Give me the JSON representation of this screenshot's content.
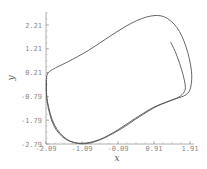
{
  "chart_data": {
    "type": "line",
    "title": "",
    "xlabel": "x",
    "ylabel": "y",
    "xlim": [
      -2.09,
      1.91
    ],
    "ylim": [
      -2.79,
      2.71
    ],
    "x_ticks": [
      "-2.09",
      "-1.09",
      "-0.09",
      "0.91",
      "1.91"
    ],
    "y_ticks": [
      "-2.79",
      "-1.79",
      "-0.79",
      "0.21",
      "1.21",
      "2.21"
    ],
    "grid": false,
    "legend": null,
    "series": [
      {
        "name": "trajectory (limit cycle)",
        "color": "#555555",
        "points": [
          [
            1.37,
            1.49
          ],
          [
            1.5,
            1.1
          ],
          [
            1.62,
            0.6
          ],
          [
            1.72,
            0.1
          ],
          [
            1.78,
            -0.35
          ],
          [
            1.75,
            -0.6
          ],
          [
            1.6,
            -0.82
          ],
          [
            1.3,
            -1.0
          ],
          [
            0.9,
            -1.25
          ],
          [
            0.4,
            -1.7
          ],
          [
            -0.1,
            -2.2
          ],
          [
            -0.6,
            -2.6
          ],
          [
            -1.09,
            -2.76
          ],
          [
            -1.5,
            -2.6
          ],
          [
            -1.85,
            -2.0
          ],
          [
            -2.05,
            -1.0
          ],
          [
            -2.08,
            -0.2
          ],
          [
            -2.05,
            0.15
          ],
          [
            -1.9,
            0.35
          ],
          [
            -1.5,
            0.65
          ],
          [
            -0.9,
            1.15
          ],
          [
            -0.3,
            1.75
          ],
          [
            0.3,
            2.3
          ],
          [
            0.8,
            2.58
          ],
          [
            1.2,
            2.55
          ],
          [
            1.55,
            2.1
          ],
          [
            1.8,
            1.3
          ],
          [
            1.95,
            0.3
          ],
          [
            1.93,
            -0.4
          ],
          [
            1.8,
            -0.72
          ],
          [
            1.5,
            -0.9
          ],
          [
            1.0,
            -1.2
          ],
          [
            0.5,
            -1.65
          ],
          [
            0.0,
            -2.15
          ],
          [
            -0.6,
            -2.62
          ],
          [
            -1.09,
            -2.78
          ],
          [
            -1.55,
            -2.58
          ],
          [
            -1.88,
            -2.0
          ],
          [
            -2.06,
            -1.0
          ],
          [
            -2.08,
            -0.1
          ]
        ]
      }
    ]
  }
}
